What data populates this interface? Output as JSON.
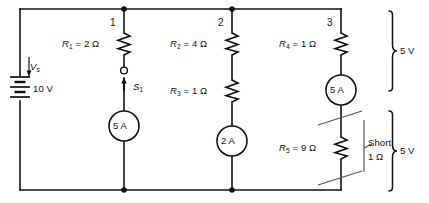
{
  "figure": {
    "ink_color": "#111111",
    "background": "#ffffff"
  },
  "source": {
    "symbol": "battery",
    "name_label": "V",
    "name_sub": "s",
    "value_label": "10 V"
  },
  "nodes": [
    {
      "id": "node-1",
      "label": "1"
    },
    {
      "id": "node-2",
      "label": "2"
    },
    {
      "id": "node-3",
      "label": "3"
    }
  ],
  "components": {
    "r1": {
      "name": "R",
      "sub": "1",
      "eq": " = 2 ",
      "unit": "Ω",
      "full": "R1 = 2 Ω"
    },
    "r2": {
      "name": "R",
      "sub": "2",
      "eq": " = 4 ",
      "unit": "Ω",
      "full": "R2 = 4 Ω"
    },
    "r3": {
      "name": "R",
      "sub": "3",
      "eq": " = 1 ",
      "unit": "Ω",
      "full": "R3 = 1 Ω"
    },
    "r4": {
      "name": "R",
      "sub": "4",
      "eq": " = 1 ",
      "unit": "Ω",
      "full": "R4 = 1 Ω"
    },
    "r5": {
      "name": "R",
      "sub": "5",
      "eq": " = 9 ",
      "unit": "Ω",
      "full": "R5 = 9 Ω"
    },
    "switch": {
      "name": "S",
      "sub": "1",
      "full": "S1"
    }
  },
  "meters": [
    {
      "id": "ammeter-branch-1",
      "reading": "5 A"
    },
    {
      "id": "ammeter-branch-2",
      "reading": "2 A"
    },
    {
      "id": "ammeter-branch-3",
      "reading": "5 A"
    }
  ],
  "annotations": {
    "short": {
      "line1": "Short",
      "line2": "1 Ω"
    }
  },
  "brackets": [
    {
      "id": "bracket-upper",
      "label": "5 V"
    },
    {
      "id": "bracket-lower",
      "label": "5 V"
    }
  ]
}
